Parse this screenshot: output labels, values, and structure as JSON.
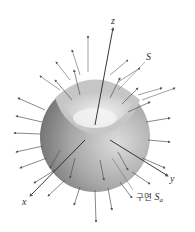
{
  "figure": {
    "labels": {
      "z": "z",
      "x": "x",
      "y": "y",
      "S": "S",
      "sphere_prefix": "구면",
      "sphere_S": "S",
      "sphere_sub": "a"
    },
    "colors": {
      "sphere_dark": "#8a8a8a",
      "sphere_light": "#d8d8d8",
      "inner": "#e8e8e8",
      "arrow": "#555555"
    }
  }
}
